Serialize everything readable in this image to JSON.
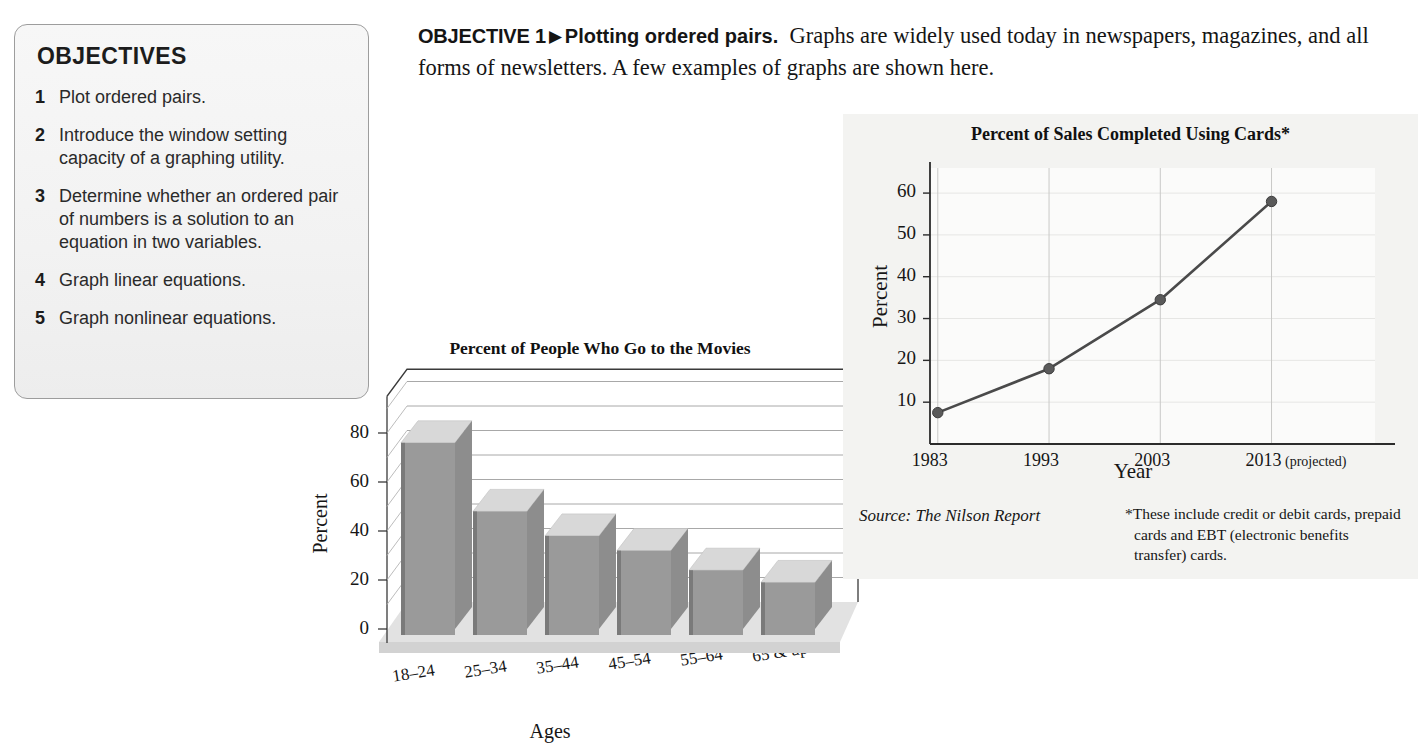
{
  "objectives_box": {
    "title": "OBJECTIVES",
    "items": [
      {
        "num": "1",
        "text": "Plot ordered pairs."
      },
      {
        "num": "2",
        "text": "Introduce the window setting capacity of a graphing utility."
      },
      {
        "num": "3",
        "text": "Determine whether an ordered pair of numbers is a solution to an equation in two variables."
      },
      {
        "num": "4",
        "text": "Graph linear equations."
      },
      {
        "num": "5",
        "text": "Graph nonlinear equations."
      }
    ]
  },
  "objective_header": {
    "label": "OBJECTIVE 1",
    "arrow": "▶",
    "lead": "Plotting ordered pairs.",
    "body": "Graphs are widely used today in newspapers, magazines, and all forms of newsletters. A few examples of graphs are shown here."
  },
  "chart_data": [
    {
      "type": "bar",
      "title": "Percent of People Who Go to the Movies",
      "xlabel": "Ages",
      "ylabel": "Percent",
      "categories": [
        "18–24",
        "25–34",
        "35–44",
        "45–54",
        "55–64",
        "65 & up"
      ],
      "values": [
        81,
        53,
        44,
        37,
        28,
        25
      ],
      "front_face_values": [
        76,
        48,
        38,
        32,
        24,
        19
      ],
      "ytick_labels": [
        "0",
        "20",
        "40",
        "60",
        "80"
      ],
      "ytick_values": [
        0,
        20,
        40,
        60,
        80
      ],
      "ylim": [
        0,
        95
      ],
      "grid": true,
      "grid_step": 10,
      "style": "3d-perspective",
      "legend": "none",
      "bar_face_color": "#9a9a9a",
      "bar_top_color": "#d8d8d8",
      "bar_side_color": "#6f6f6f",
      "floor_color": "#dedede"
    },
    {
      "type": "line",
      "title": "Percent of Sales Completed Using Cards*",
      "xlabel": "Year",
      "ylabel": "Percent",
      "x": [
        "1983",
        "1993",
        "2003",
        "2013"
      ],
      "x_suffix": " (projected)",
      "values": [
        7.5,
        18,
        34.5,
        58
      ],
      "ytick_labels": [
        "10",
        "20",
        "30",
        "40",
        "50",
        "60"
      ],
      "ytick_values": [
        10,
        20,
        30,
        40,
        50,
        60
      ],
      "ylim": [
        0,
        66
      ],
      "grid": true,
      "grid_orientation": "vertical",
      "legend": "none",
      "line_color": "#4a4a4a",
      "marker_color": "#5a5a5a",
      "panel_color": "#f3f3f1",
      "source": "Source: The Nilson Report",
      "footnote": "*These include credit or debit cards, prepaid cards and EBT (electronic benefits transfer) cards."
    }
  ]
}
